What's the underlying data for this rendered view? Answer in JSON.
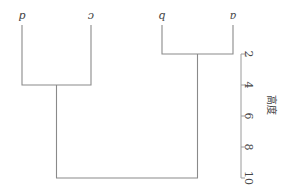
{
  "chart_data": {
    "type": "dendrogram",
    "orientation_note": "image is rendered rotated 180 degrees",
    "leaves": [
      "a",
      "b",
      "c",
      "d"
    ],
    "merges": [
      {
        "left": "a",
        "right": "b",
        "height": 2
      },
      {
        "left": "c",
        "right": "d",
        "height": 4
      },
      {
        "left": "ab",
        "right": "cd",
        "height": 10
      }
    ],
    "ylabel": "高度",
    "yticks": [
      2,
      4,
      6,
      8,
      10
    ],
    "ylim": [
      2,
      10
    ],
    "colors": {
      "links": "#8a8a8a",
      "axis": "#9a9a9a",
      "text": "#444444"
    }
  }
}
